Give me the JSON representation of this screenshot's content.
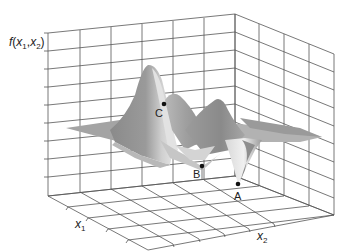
{
  "figure": {
    "type": "3d-surface",
    "zlabel": "f(x1,x2)",
    "xlabel": "x1",
    "ylabel": "x2",
    "points": [
      {
        "label": "C",
        "x": 164,
        "y": 104
      },
      {
        "label": "B",
        "x": 202,
        "y": 166
      },
      {
        "label": "A",
        "x": 238,
        "y": 184
      }
    ]
  },
  "labels": {
    "z_f": "f",
    "z_open": "(",
    "z_x1": "x",
    "z_sub1": "1",
    "z_comma": ",",
    "z_x2": "x",
    "z_sub2": "2",
    "z_close": ")",
    "x1": "x",
    "x1_sub": "1",
    "x2": "x",
    "x2_sub": "2",
    "pt_a": "A",
    "pt_b": "B",
    "pt_c": "C"
  },
  "colors": {
    "grid": "#555555",
    "surface_dark": "#8c8c8c",
    "surface_mid": "#a8a8a8",
    "surface_light": "#d6d6d6",
    "marker": "#111111"
  }
}
